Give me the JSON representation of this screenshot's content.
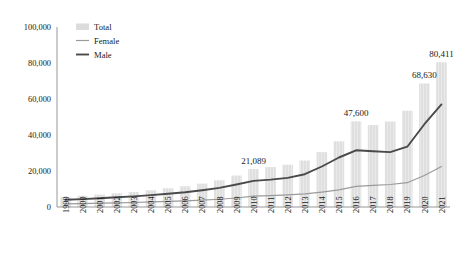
{
  "chart_data": {
    "type": "bar",
    "title": "",
    "subtitle": "",
    "xlabel": "",
    "ylabel": "",
    "ylim": [
      0,
      100000
    ],
    "y_ticks": [
      "0",
      "20,000",
      "40,000",
      "60,000",
      "80,000",
      "100,000"
    ],
    "y_tick_values": [
      0,
      20000,
      40000,
      60000,
      80000,
      100000
    ],
    "grid": false,
    "legend_position": "top-left",
    "legend": [
      {
        "name": "Total",
        "marker": "bar-swatch",
        "color": "#dcdcdc"
      },
      {
        "name": "Female",
        "marker": "line",
        "color": "#9a9a9a"
      },
      {
        "name": "Male",
        "marker": "line",
        "color": "#4a4a4a"
      }
    ],
    "categories": [
      "1999",
      "2000",
      "2001",
      "2002",
      "2003",
      "2004",
      "2005",
      "2006",
      "2007",
      "2008",
      "2009",
      "2010",
      "2011",
      "2012",
      "2013",
      "2014",
      "2015",
      "2016",
      "2017",
      "2018",
      "2019",
      "2020",
      "2021"
    ],
    "series": [
      {
        "name": "Total",
        "type": "bar",
        "color": "#dcdcdc",
        "values": [
          5500,
          6200,
          6900,
          7600,
          8300,
          9300,
          10400,
          11500,
          13000,
          14800,
          17500,
          21089,
          22200,
          23500,
          25800,
          30500,
          36500,
          47600,
          45500,
          47500,
          53500,
          68630,
          80411
        ]
      },
      {
        "name": "Male",
        "type": "line",
        "color": "#4a4a4a",
        "values": [
          4000,
          4400,
          4900,
          5400,
          5900,
          6600,
          7400,
          8200,
          9300,
          10600,
          12500,
          14500,
          15200,
          16200,
          18200,
          22500,
          27500,
          31500,
          31000,
          30500,
          33500,
          46000,
          57000
        ]
      },
      {
        "name": "Female",
        "type": "line",
        "color": "#9a9a9a",
        "values": [
          1700,
          1900,
          2100,
          2300,
          2500,
          2800,
          3100,
          3400,
          3800,
          4300,
          5000,
          6000,
          6300,
          6700,
          7300,
          8300,
          9500,
          11500,
          12000,
          12500,
          13500,
          17500,
          22500
        ]
      }
    ],
    "data_labels": [
      {
        "category": "2010",
        "text": "21,089",
        "value": 21089
      },
      {
        "category": "2016",
        "text": "47,600",
        "value": 47600
      },
      {
        "category": "2020",
        "text": "68,630",
        "value": 68630
      },
      {
        "category": "2021",
        "text": "80,411",
        "value": 80411
      }
    ]
  }
}
